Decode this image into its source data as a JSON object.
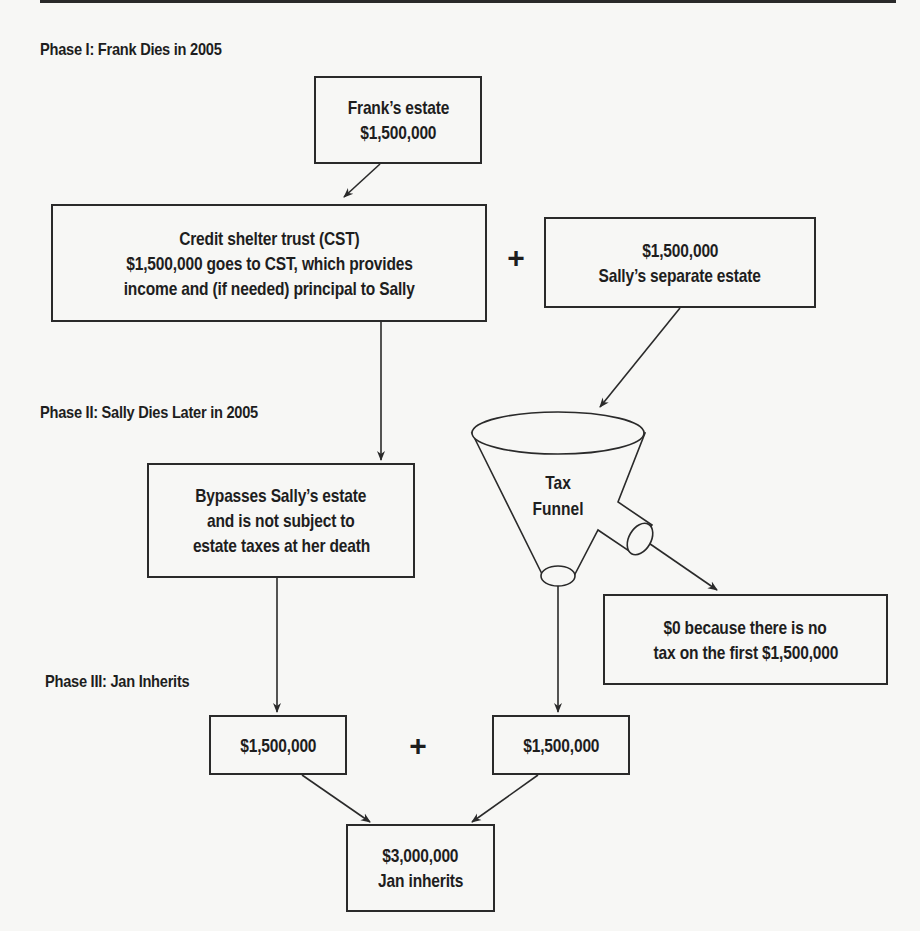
{
  "phases": {
    "phase1": "Phase I: Frank Dies in 2005",
    "phase2": "Phase II: Sally Dies Later in 2005",
    "phase3": "Phase III: Jan Inherits"
  },
  "boxes": {
    "frank_estate": [
      "Frank’s estate",
      "$1,500,000"
    ],
    "credit_shelter_trust": [
      "Credit shelter trust (CST)",
      "$1,500,000 goes to CST, which provides",
      "income and (if needed) principal to Sally"
    ],
    "sally_separate_estate": [
      "$1,500,000",
      "Sally’s separate estate"
    ],
    "bypass": [
      "Bypasses Sally’s estate",
      "and is not subject to",
      "estate taxes at her death"
    ],
    "zero_tax": [
      "$0 because there is no",
      "tax on the first $1,500,000"
    ],
    "jan_left": [
      "$1,500,000"
    ],
    "jan_right": [
      "$1,500,000"
    ],
    "jan_total": [
      "$3,000,000",
      "Jan inherits"
    ]
  },
  "funnel": {
    "label": [
      "Tax",
      "Funnel"
    ]
  },
  "operators": {
    "plus_top": "+",
    "plus_bottom": "+"
  },
  "colors": {
    "background": "#f7f7f5",
    "ink": "#1e1e1e",
    "stroke": "#2a2a2a"
  }
}
